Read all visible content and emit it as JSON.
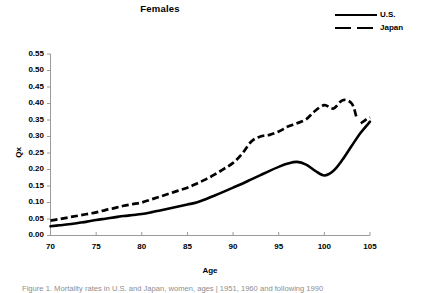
{
  "chart_data": {
    "type": "line",
    "title": "Females",
    "xlabel": "Age",
    "ylabel": "Qx",
    "xlim": [
      70,
      105
    ],
    "ylim": [
      0.0,
      0.55
    ],
    "grid": false,
    "legend_position": "top-right",
    "xticks": [
      "70",
      "75",
      "80",
      "85",
      "90",
      "95",
      "100",
      "105"
    ],
    "yticks": [
      "0.00",
      "0.05",
      "0.10",
      "0.15",
      "0.20",
      "0.25",
      "0.30",
      "0.35",
      "0.40",
      "0.45",
      "0.50",
      "0.55"
    ],
    "series": [
      {
        "name": "U.S.",
        "style": "solid",
        "color": "#000000",
        "x": [
          70,
          71,
          72,
          73,
          74,
          75,
          76,
          77,
          78,
          79,
          80,
          81,
          82,
          83,
          84,
          85,
          86,
          87,
          88,
          89,
          90,
          91,
          92,
          93,
          94,
          95,
          96,
          97,
          98,
          99,
          100,
          101,
          102,
          103,
          104,
          105
        ],
        "values": [
          0.028,
          0.031,
          0.034,
          0.038,
          0.042,
          0.047,
          0.051,
          0.055,
          0.059,
          0.062,
          0.065,
          0.07,
          0.076,
          0.082,
          0.088,
          0.094,
          0.1,
          0.11,
          0.121,
          0.133,
          0.145,
          0.157,
          0.17,
          0.183,
          0.196,
          0.208,
          0.218,
          0.223,
          0.215,
          0.196,
          0.182,
          0.196,
          0.23,
          0.272,
          0.312,
          0.345
        ]
      },
      {
        "name": "Japan",
        "style": "dashed",
        "color": "#000000",
        "x": [
          70,
          71,
          72,
          73,
          74,
          75,
          76,
          77,
          78,
          79,
          80,
          81,
          82,
          83,
          84,
          85,
          86,
          87,
          88,
          89,
          90,
          91,
          92,
          93,
          94,
          95,
          96,
          97,
          98,
          99,
          100,
          101,
          102,
          103,
          103.5
        ],
        "values": [
          0.045,
          0.05,
          0.055,
          0.06,
          0.065,
          0.07,
          0.077,
          0.083,
          0.09,
          0.095,
          0.1,
          0.109,
          0.118,
          0.127,
          0.136,
          0.145,
          0.157,
          0.17,
          0.185,
          0.202,
          0.22,
          0.248,
          0.285,
          0.3,
          0.305,
          0.315,
          0.33,
          0.34,
          0.352,
          0.378,
          0.395,
          0.385,
          0.41,
          0.4,
          0.36
        ]
      },
      {
        "name": "Japan-tail",
        "style": "dashed",
        "color": "#000000",
        "x": [
          104,
          104.6,
          105
        ],
        "values": [
          0.34,
          0.352,
          0.358
        ]
      }
    ]
  },
  "legend": {
    "items": [
      {
        "label": "U.S.",
        "style": "solid"
      },
      {
        "label": "Japan",
        "style": "dashed"
      }
    ]
  },
  "caption": {
    "text": "Figure 1.  Mortality rates in U.S. and Japan, women, ages  |  1951, 1960  and  following  1990"
  }
}
